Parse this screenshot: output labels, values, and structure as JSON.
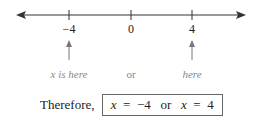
{
  "number_line": {
    "ticks": [
      {
        "value": -4,
        "label": "−4"
      },
      {
        "value": 0,
        "label": "0"
      },
      {
        "value": 4,
        "label": "4"
      }
    ],
    "arrows_both_ends": true
  },
  "annotations": {
    "left": "x is here",
    "middle": "or",
    "right": "here"
  },
  "conclusion": {
    "prefix": "Therefore,",
    "var1": "x",
    "eq1": "=",
    "val1": "−4",
    "connector": "or",
    "var2": "x",
    "eq2": "=",
    "val2": "4"
  },
  "colors": {
    "line": "#333333",
    "annotation": "#888888",
    "box_border": "#666666"
  }
}
